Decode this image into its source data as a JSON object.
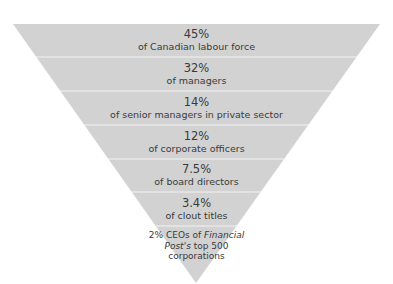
{
  "diagram": {
    "type": "inverted-pyramid",
    "fill_color": "#d2d2d2",
    "divider_color": "#f2f2f2",
    "text_color": "#3a3a3a",
    "tiers": [
      {
        "value": "45%",
        "label": "of Canadian labour force"
      },
      {
        "value": "32%",
        "label": "of managers"
      },
      {
        "value": "14%",
        "label": "of senior managers in private sector"
      },
      {
        "value": "12%",
        "label": "of corporate officers"
      },
      {
        "value": "7.5%",
        "label": "of board directors"
      },
      {
        "value": "3.4%",
        "label": "of clout titles"
      },
      {
        "value": "",
        "label_line1_pre": "2% CEOs of ",
        "label_line1_italic": "Financial",
        "label_line2_italic": "Post's",
        "label_line2_post": " top 500",
        "label_line3": "corporations"
      }
    ]
  }
}
